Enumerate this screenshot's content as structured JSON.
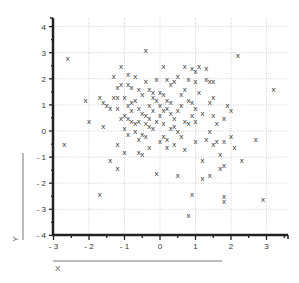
{
  "chart_data": {
    "type": "scatter",
    "title": "",
    "xlabel": "X",
    "ylabel": "Y",
    "xlim": [
      -3,
      3.5
    ],
    "ylim": [
      -4,
      4.3
    ],
    "grid": true,
    "marker": "x",
    "xticks": [
      -3,
      -2,
      -1,
      0,
      1,
      2,
      3
    ],
    "yticks": [
      -4,
      -3,
      -2,
      -1,
      0,
      1,
      2,
      3,
      4
    ],
    "xtick_labels": [
      "- 3",
      "- 2",
      "- 1",
      "0",
      "1",
      "2",
      "3"
    ],
    "ytick_labels": [
      "- 4",
      "- 3",
      "- 2",
      "- 1",
      "0",
      "1",
      "2",
      "3",
      "4"
    ],
    "series": [
      {
        "name": "data",
        "points": [
          [
            -2.6,
            2.8
          ],
          [
            -2.7,
            -0.5
          ],
          [
            -1.7,
            -2.4
          ],
          [
            -1.4,
            -1.1
          ],
          [
            -1.2,
            -1.4
          ],
          [
            -1.2,
            -0.5
          ],
          [
            -1.0,
            -0.8
          ],
          [
            -0.6,
            -0.8
          ],
          [
            -0.5,
            -0.9
          ],
          [
            -0.4,
            3.1
          ],
          [
            -2.0,
            0.4
          ],
          [
            -1.6,
            0.2
          ],
          [
            -2.1,
            1.2
          ],
          [
            -1.7,
            1.3
          ],
          [
            -1.6,
            1.1
          ],
          [
            -1.5,
            1.0
          ],
          [
            -1.4,
            0.9
          ],
          [
            -1.3,
            1.3
          ],
          [
            -1.2,
            1.3
          ],
          [
            -1.2,
            0.9
          ],
          [
            -1.1,
            2.5
          ],
          [
            -1.3,
            2.1
          ],
          [
            -1.2,
            1.7
          ],
          [
            -1.1,
            1.8
          ],
          [
            -1.0,
            1.3
          ],
          [
            -0.9,
            2.2
          ],
          [
            -0.9,
            1.8
          ],
          [
            -0.8,
            1.7
          ],
          [
            -0.7,
            2.1
          ],
          [
            -0.6,
            1.6
          ],
          [
            -0.5,
            1.4
          ],
          [
            -0.4,
            1.9
          ],
          [
            -0.3,
            1.6
          ],
          [
            -0.2,
            1.5
          ],
          [
            -0.1,
            2.0
          ],
          [
            -1.1,
            0.5
          ],
          [
            -1.0,
            0.6
          ],
          [
            -0.9,
            0.5
          ],
          [
            -0.8,
            0.4
          ],
          [
            -0.8,
            1.1
          ],
          [
            -0.7,
            1.2
          ],
          [
            -0.6,
            0.9
          ],
          [
            -0.5,
            0.7
          ],
          [
            -0.4,
            0.6
          ],
          [
            -0.3,
            1.0
          ],
          [
            -0.9,
            1.0
          ],
          [
            -0.8,
            0.8
          ],
          [
            -0.7,
            0.3
          ],
          [
            -0.6,
            0.4
          ],
          [
            -0.4,
            0.3
          ],
          [
            -0.3,
            0.5
          ],
          [
            -0.2,
            0.8
          ],
          [
            -0.1,
            1.2
          ],
          [
            0.0,
            1.0
          ],
          [
            0.1,
            0.8
          ],
          [
            -1.0,
            0.1
          ],
          [
            -0.9,
            -0.1
          ],
          [
            -0.7,
            0.0
          ],
          [
            -0.5,
            -0.1
          ],
          [
            -0.4,
            -0.2
          ],
          [
            -0.3,
            0.2
          ],
          [
            -0.2,
            0.1
          ],
          [
            -0.1,
            0.4
          ],
          [
            0.0,
            0.6
          ],
          [
            0.1,
            0.3
          ],
          [
            -0.2,
            1.3
          ],
          [
            0.0,
            1.5
          ],
          [
            0.1,
            1.4
          ],
          [
            0.2,
            1.2
          ],
          [
            0.3,
            1.1
          ],
          [
            0.2,
            0.9
          ],
          [
            0.3,
            0.7
          ],
          [
            0.4,
            0.5
          ],
          [
            0.5,
            0.8
          ],
          [
            0.6,
            1.0
          ],
          [
            0.1,
            2.5
          ],
          [
            0.2,
            2.0
          ],
          [
            0.3,
            1.8
          ],
          [
            0.4,
            1.9
          ],
          [
            0.5,
            2.1
          ],
          [
            0.6,
            1.4
          ],
          [
            0.7,
            1.6
          ],
          [
            0.8,
            1.2
          ],
          [
            0.9,
            1.1
          ],
          [
            1.0,
            0.9
          ],
          [
            0.4,
            0.2
          ],
          [
            0.5,
            0.0
          ],
          [
            0.6,
            -0.2
          ],
          [
            0.8,
            0.3
          ],
          [
            1.0,
            0.4
          ],
          [
            0.1,
            -0.2
          ],
          [
            0.2,
            -0.3
          ],
          [
            0.3,
            0.1
          ],
          [
            0.7,
            0.4
          ],
          [
            0.9,
            0.6
          ],
          [
            0.7,
            2.5
          ],
          [
            0.9,
            2.4
          ],
          [
            1.0,
            2.3
          ],
          [
            1.1,
            2.5
          ],
          [
            1.3,
            2.4
          ],
          [
            0.8,
            2.0
          ],
          [
            1.0,
            1.9
          ],
          [
            1.3,
            2.0
          ],
          [
            1.4,
            1.9
          ],
          [
            1.5,
            1.9
          ],
          [
            1.1,
            1.5
          ],
          [
            1.4,
            1.1
          ],
          [
            1.5,
            1.3
          ],
          [
            1.9,
            1.0
          ],
          [
            2.0,
            0.8
          ],
          [
            1.2,
            0.7
          ],
          [
            1.5,
            0.6
          ],
          [
            1.6,
            0.3
          ],
          [
            1.8,
            0.5
          ],
          [
            1.4,
            0.0
          ],
          [
            1.0,
            -0.4
          ],
          [
            0.7,
            -0.7
          ],
          [
            0.4,
            -0.5
          ],
          [
            0.2,
            -0.6
          ],
          [
            0.0,
            -0.4
          ],
          [
            1.3,
            -0.3
          ],
          [
            1.5,
            -0.5
          ],
          [
            1.6,
            -0.4
          ],
          [
            1.8,
            -0.4
          ],
          [
            1.7,
            -0.9
          ],
          [
            1.2,
            -1.1
          ],
          [
            1.2,
            -1.8
          ],
          [
            1.4,
            -1.7
          ],
          [
            1.7,
            -1.4
          ],
          [
            1.8,
            -1.3
          ],
          [
            2.0,
            -0.2
          ],
          [
            2.1,
            -0.6
          ],
          [
            2.3,
            -1.1
          ],
          [
            1.8,
            -2.5
          ],
          [
            2.7,
            -0.3
          ],
          [
            0.9,
            -2.4
          ],
          [
            0.8,
            -3.2
          ],
          [
            1.8,
            -2.7
          ],
          [
            2.9,
            -2.6
          ],
          [
            2.2,
            2.9
          ],
          [
            3.2,
            1.6
          ],
          [
            -0.1,
            -1.6
          ],
          [
            0.5,
            -1.7
          ],
          [
            -0.3,
            -0.6
          ],
          [
            -0.6,
            -0.3
          ]
        ]
      }
    ]
  }
}
